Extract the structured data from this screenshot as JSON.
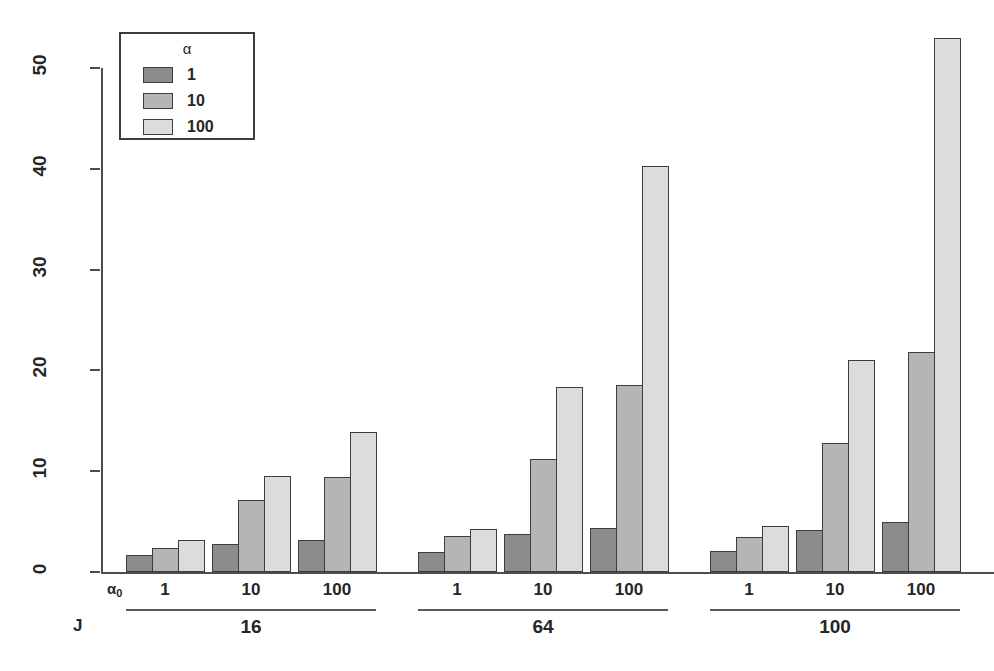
{
  "chart_data": {
    "type": "bar",
    "title": "",
    "xlabel": "",
    "ylabel": "Average Mixture Size",
    "ylim": [
      0,
      55
    ],
    "yticks": [
      0,
      10,
      20,
      30,
      40,
      50
    ],
    "ytick_labels": [
      "0",
      "10",
      "20",
      "30",
      "40",
      "50"
    ],
    "grid": false,
    "legend_position": "top-left",
    "legend_title": "α",
    "series": [
      {
        "name": "1",
        "color": "#8c8c8c",
        "values": [
          1.7,
          2.8,
          3.2,
          2.0,
          3.8,
          4.4,
          2.1,
          4.2,
          5.0
        ]
      },
      {
        "name": "10",
        "color": "#b5b5b5",
        "values": [
          2.4,
          7.1,
          9.4,
          3.6,
          11.2,
          18.6,
          3.5,
          12.8,
          21.8
        ]
      },
      {
        "name": "100",
        "color": "#dcdcdc",
        "values": [
          3.2,
          9.5,
          13.9,
          4.3,
          18.4,
          40.3,
          4.6,
          21.0,
          53.0
        ]
      }
    ],
    "categories": [
      "1",
      "10",
      "100",
      "1",
      "10",
      "100",
      "1",
      "10",
      "100"
    ],
    "group_axis_name": "α₀",
    "panel_axis_name": "J",
    "panels": [
      {
        "label": "16",
        "groups": [
          0,
          1,
          2
        ]
      },
      {
        "label": "64",
        "groups": [
          3,
          4,
          5
        ]
      },
      {
        "label": "100",
        "groups": [
          6,
          7,
          8
        ]
      }
    ],
    "annotations": []
  },
  "legend": {
    "title": "α",
    "entries": [
      {
        "label": "1",
        "color": "#8c8c8c"
      },
      {
        "label": "10",
        "color": "#b5b5b5"
      },
      {
        "label": "100",
        "color": "#dcdcdc"
      }
    ]
  },
  "axes": {
    "y_title": "Average Mixture Size",
    "x_group_name": "α₀",
    "x_panel_name": "J"
  }
}
